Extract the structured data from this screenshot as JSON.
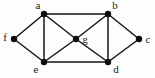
{
  "figure": {
    "name": "undirected-graph-diagram",
    "width": 155,
    "height": 78,
    "background_color": "#fdfdfd",
    "edge_color": "#161616",
    "vertex_color": "#0d0d0d",
    "label_color": "#1a1a1a"
  },
  "chart_data": {
    "type": "diagram",
    "graph_type": "undirected-graph",
    "title": "",
    "vertex_count": 7,
    "edge_count": 12,
    "vertices": [
      {
        "id": "a",
        "label": "a",
        "x": 44,
        "y": 14,
        "label_x": 38,
        "label_y": 6,
        "label_anchor": "middle"
      },
      {
        "id": "b",
        "label": "b",
        "x": 108,
        "y": 14,
        "label_x": 115,
        "label_y": 6,
        "label_anchor": "middle"
      },
      {
        "id": "c",
        "label": "c",
        "x": 139,
        "y": 39,
        "label_x": 148,
        "label_y": 40,
        "label_anchor": "middle"
      },
      {
        "id": "d",
        "label": "d",
        "x": 108,
        "y": 62,
        "label_x": 116,
        "label_y": 70,
        "label_anchor": "middle"
      },
      {
        "id": "e",
        "label": "e",
        "x": 44,
        "y": 62,
        "label_x": 36,
        "label_y": 70,
        "label_anchor": "middle"
      },
      {
        "id": "f",
        "label": "f",
        "x": 14,
        "y": 39,
        "label_x": 5,
        "label_y": 38,
        "label_anchor": "middle"
      },
      {
        "id": "g",
        "label": "g",
        "x": 76,
        "y": 39,
        "label_x": 85,
        "label_y": 40,
        "label_anchor": "middle"
      }
    ],
    "edges": [
      {
        "source": "a",
        "target": "b"
      },
      {
        "source": "a",
        "target": "f"
      },
      {
        "source": "a",
        "target": "e"
      },
      {
        "source": "a",
        "target": "g"
      },
      {
        "source": "f",
        "target": "e"
      },
      {
        "source": "e",
        "target": "g"
      },
      {
        "source": "e",
        "target": "d"
      },
      {
        "source": "g",
        "target": "b"
      },
      {
        "source": "g",
        "target": "d"
      },
      {
        "source": "b",
        "target": "c"
      },
      {
        "source": "b",
        "target": "d"
      },
      {
        "source": "c",
        "target": "d"
      }
    ]
  }
}
